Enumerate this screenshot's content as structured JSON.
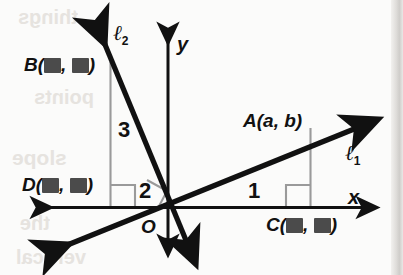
{
  "figure": {
    "type": "coordinate-geometry-diagram",
    "axes": {
      "x_label": "x",
      "y_label": "y",
      "origin_label": "O"
    },
    "lines": [
      {
        "id": "line-1",
        "label": "ℓ",
        "subscript": "1",
        "slope_run": "1",
        "direction": "rising-left-to-right"
      },
      {
        "id": "line-2",
        "label": "ℓ",
        "subscript": "2",
        "slope_rise": "3",
        "slope_run": "2",
        "direction": "falling-left-to-right"
      }
    ],
    "slope_numbers": {
      "line1_run": "1",
      "line2_rise": "3",
      "line2_run": "2"
    },
    "points": [
      {
        "name": "A",
        "label": "A(a, b)",
        "text_prefix": "A(",
        "x_value": "a",
        "separator": ", ",
        "y_value": "b",
        "text_suffix": ")",
        "redacted": false
      },
      {
        "name": "B",
        "label": "B(■, ■)",
        "text_prefix": "B(",
        "separator": ", ",
        "text_suffix": ")",
        "redacted": true
      },
      {
        "name": "C",
        "label": "C(■, ■)",
        "text_prefix": "C(",
        "separator": ", ",
        "text_suffix": ")",
        "redacted": true
      },
      {
        "name": "D",
        "label": "D(■, ■)",
        "text_prefix": "D(",
        "separator": ", ",
        "text_suffix": ")",
        "redacted": true
      }
    ],
    "right_angle_markers": 3,
    "colors": {
      "ink": "#111111",
      "construction_line": "#9a9a9a",
      "redaction_block": "#4b4b4b",
      "paper": "#fbfbfa",
      "ghost_text": "#e6e3df"
    }
  },
  "labels": {
    "point_a_prefix": "A(",
    "point_a_x": "a",
    "point_a_comma": ", ",
    "point_a_y": "b",
    "point_a_suffix": ")",
    "point_b_prefix": "B(",
    "point_b_comma": ", ",
    "point_b_suffix": ")",
    "point_c_prefix": "C(",
    "point_c_comma": ", ",
    "point_c_suffix": ")",
    "point_d_prefix": "D(",
    "point_d_comma": ", ",
    "point_d_suffix": ")",
    "num_one": "1",
    "num_two": "2",
    "num_three": "3",
    "axis_x": "x",
    "axis_y": "y",
    "origin": "O",
    "ell": "ℓ",
    "sub_one": "1",
    "sub_two": "2"
  },
  "ghost_text": {
    "line1": "things",
    "line2": "points",
    "line3": "slope",
    "line4": "the",
    "line5": "vertical"
  }
}
